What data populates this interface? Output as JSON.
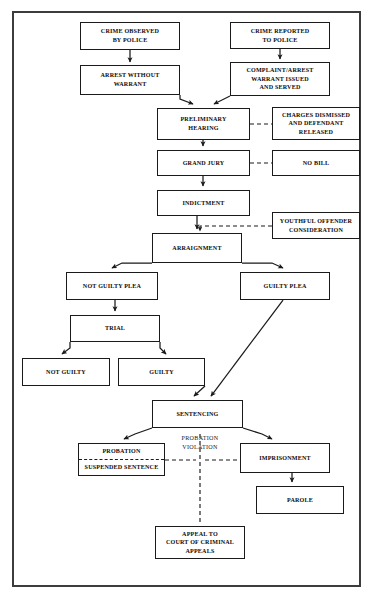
{
  "diagram": {
    "frame": {
      "name": "outer-border"
    },
    "nodes": [
      {
        "id": "crime-observed",
        "lines": [
          "Crime Observed",
          "by Police"
        ],
        "x": 80,
        "y": 22,
        "w": 100,
        "h": 28
      },
      {
        "id": "crime-reported",
        "lines": [
          "Crime Reported",
          "to Police"
        ],
        "x": 230,
        "y": 22,
        "w": 100,
        "h": 27
      },
      {
        "id": "arrest-without-warrant",
        "lines": [
          "Arrest Without",
          "Warrant"
        ],
        "x": 80,
        "y": 65,
        "w": 100,
        "h": 30
      },
      {
        "id": "complaint-warrant",
        "lines": [
          "Complaint/Arrest",
          "Warrant Issued",
          "and Served"
        ],
        "x": 230,
        "y": 62,
        "w": 100,
        "h": 34
      },
      {
        "id": "preliminary-hearing",
        "lines": [
          "Preliminary",
          "Hearing"
        ],
        "x": 157,
        "y": 108,
        "w": 93,
        "h": 32
      },
      {
        "id": "charges-dismissed",
        "lines": [
          "Charges Dismissed",
          "and Defendant",
          "Released"
        ],
        "x": 272,
        "y": 107,
        "w": 88,
        "h": 33
      },
      {
        "id": "grand-jury",
        "lines": [
          "Grand Jury"
        ],
        "x": 157,
        "y": 150,
        "w": 93,
        "h": 26
      },
      {
        "id": "no-bill",
        "lines": [
          "No Bill"
        ],
        "x": 272,
        "y": 150,
        "w": 88,
        "h": 26
      },
      {
        "id": "indictment",
        "lines": [
          "Indictment"
        ],
        "x": 157,
        "y": 190,
        "w": 93,
        "h": 26
      },
      {
        "id": "youthful-offender",
        "lines": [
          "Youthful Offender",
          "Consideration"
        ],
        "x": 272,
        "y": 212,
        "w": 88,
        "h": 27
      },
      {
        "id": "arraignment",
        "lines": [
          "Arraignment"
        ],
        "x": 152,
        "y": 233,
        "w": 90,
        "h": 30
      },
      {
        "id": "not-guilty-plea",
        "lines": [
          "Not Guilty Plea"
        ],
        "x": 66,
        "y": 272,
        "w": 92,
        "h": 28
      },
      {
        "id": "guilty-plea",
        "lines": [
          "Guilty Plea"
        ],
        "x": 240,
        "y": 272,
        "w": 90,
        "h": 28
      },
      {
        "id": "trial",
        "lines": [
          "Trial"
        ],
        "x": 70,
        "y": 315,
        "w": 90,
        "h": 27
      },
      {
        "id": "not-guilty",
        "lines": [
          "Not Guilty"
        ],
        "x": 22,
        "y": 358,
        "w": 88,
        "h": 28
      },
      {
        "id": "guilty",
        "lines": [
          "Guilty"
        ],
        "x": 118,
        "y": 358,
        "w": 87,
        "h": 28
      },
      {
        "id": "sentencing",
        "lines": [
          "Sentencing"
        ],
        "x": 152,
        "y": 400,
        "w": 91,
        "h": 28
      },
      {
        "id": "imprisonment",
        "lines": [
          "Imprisonment"
        ],
        "x": 240,
        "y": 443,
        "w": 90,
        "h": 30
      },
      {
        "id": "parole",
        "lines": [
          "Parole"
        ],
        "x": 256,
        "y": 486,
        "w": 88,
        "h": 28
      },
      {
        "id": "appeal-court",
        "lines": [
          "Appeal to",
          "Court of Criminal",
          "Appeals"
        ],
        "x": 155,
        "y": 526,
        "w": 90,
        "h": 33
      }
    ],
    "split_nodes": [
      {
        "id": "probation-suspended",
        "top": "Probation",
        "bottom": "Suspended Sentence",
        "x": 78,
        "y": 443,
        "w": 87,
        "h": 33
      }
    ],
    "free_labels": [
      {
        "id": "probation-violation-label",
        "lines": [
          "Probation",
          "Violation"
        ],
        "x": 170,
        "y": 434,
        "w": 60
      }
    ],
    "colors": {
      "frame": "#3c3c3c",
      "box_border": "#1a1a1a",
      "text": "#0c0c0c",
      "background": "#ffffff",
      "connector": "#1a1a1a"
    }
  }
}
